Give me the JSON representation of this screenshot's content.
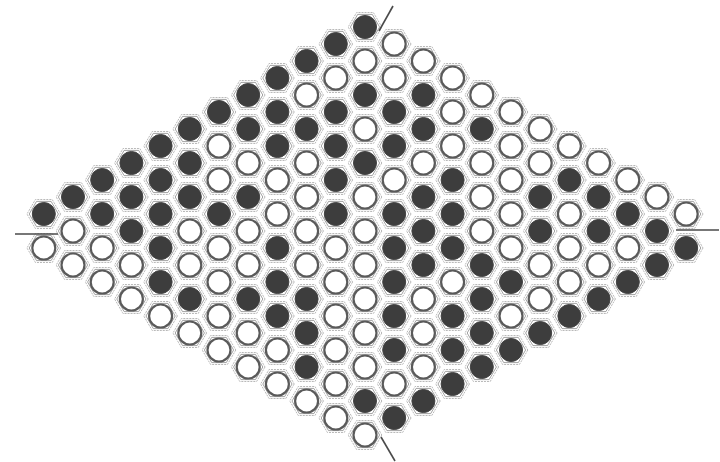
{
  "game": {
    "name": "Hex",
    "board_size": 13,
    "colors": {
      "black_stone": "#3d3d3d",
      "white_stone": "#ffffff",
      "white_ring": "#5a5a5a",
      "hex_outline": "#b9b9b9",
      "edge_line": "#4a4a4a"
    },
    "layout": {
      "center_x": 365,
      "top_y": 27,
      "col_step": 29.2,
      "row_half_step": 17.0,
      "stone_radius": 11.5,
      "hex_radius": 16.8
    },
    "edge_markers": [
      {
        "name": "top-edge-marker",
        "x1": 393,
        "y1": 6,
        "x2": 379,
        "y2": 31
      },
      {
        "name": "left-edge-marker",
        "x1": 15,
        "y1": 234,
        "x2": 58,
        "y2": 234
      },
      {
        "name": "right-edge-marker",
        "x1": 676,
        "y1": 230,
        "x2": 719,
        "y2": 230
      },
      {
        "name": "bottom-edge-marker",
        "x1": 381,
        "y1": 437,
        "x2": 395,
        "y2": 461
      }
    ],
    "columns": [
      {
        "k": 0,
        "stones": [
          "B",
          "W"
        ]
      },
      {
        "k": 1,
        "stones": [
          "B",
          "W",
          "W"
        ]
      },
      {
        "k": 2,
        "stones": [
          "B",
          "B",
          "W",
          "W"
        ]
      },
      {
        "k": 3,
        "stones": [
          "B",
          "B",
          "B",
          "W",
          "W"
        ]
      },
      {
        "k": 4,
        "stones": [
          "B",
          "B",
          "B",
          "B",
          "B",
          "W"
        ]
      },
      {
        "k": 5,
        "stones": [
          "B",
          "B",
          "B",
          "W",
          "W",
          "B",
          "W"
        ]
      },
      {
        "k": 6,
        "stones": [
          "B",
          "W",
          "W",
          "B",
          "W",
          "W",
          "W",
          "W"
        ]
      },
      {
        "k": 7,
        "stones": [
          "B",
          "B",
          "W",
          "B",
          "W",
          "W",
          "B",
          "W",
          "W"
        ]
      },
      {
        "k": 8,
        "stones": [
          "B",
          "B",
          "B",
          "W",
          "W",
          "B",
          "B",
          "B",
          "W",
          "W"
        ]
      },
      {
        "k": 9,
        "stones": [
          "B",
          "W",
          "B",
          "W",
          "W",
          "W",
          "W",
          "B",
          "B",
          "B",
          "W"
        ]
      },
      {
        "k": 10,
        "stones": [
          "B",
          "W",
          "B",
          "B",
          "B",
          "B",
          "W",
          "W",
          "W",
          "W",
          "W",
          "W"
        ]
      },
      {
        "k": 11,
        "stones": [
          "B",
          "W",
          "B",
          "W",
          "B",
          "W",
          "W",
          "W",
          "W",
          "W",
          "W",
          "B",
          "W"
        ]
      },
      {
        "k": 12,
        "stones": [
          "W",
          "W",
          "B",
          "B",
          "W",
          "B",
          "B",
          "B",
          "B",
          "B",
          "W",
          "B"
        ]
      },
      {
        "k": 13,
        "stones": [
          "W",
          "B",
          "B",
          "W",
          "B",
          "B",
          "B",
          "W",
          "W",
          "W",
          "B"
        ]
      },
      {
        "k": 14,
        "stones": [
          "W",
          "W",
          "W",
          "B",
          "B",
          "B",
          "W",
          "B",
          "B",
          "B"
        ]
      },
      {
        "k": 15,
        "stones": [
          "W",
          "B",
          "W",
          "W",
          "W",
          "B",
          "B",
          "B",
          "B"
        ]
      },
      {
        "k": 16,
        "stones": [
          "W",
          "W",
          "W",
          "W",
          "W",
          "B",
          "W",
          "B"
        ]
      },
      {
        "k": 17,
        "stones": [
          "W",
          "W",
          "B",
          "B",
          "W",
          "W",
          "B"
        ]
      },
      {
        "k": 18,
        "stones": [
          "W",
          "B",
          "W",
          "W",
          "W",
          "B"
        ]
      },
      {
        "k": 19,
        "stones": [
          "W",
          "B",
          "B",
          "W",
          "B"
        ]
      },
      {
        "k": 20,
        "stones": [
          "W",
          "B",
          "W",
          "B"
        ]
      },
      {
        "k": 21,
        "stones": [
          "W",
          "B",
          "B"
        ]
      },
      {
        "k": 22,
        "stones": [
          "W",
          "B"
        ]
      }
    ]
  }
}
